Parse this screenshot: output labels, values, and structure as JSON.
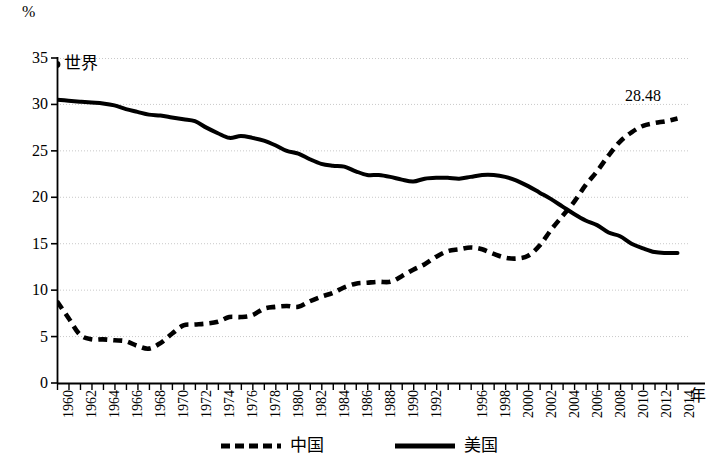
{
  "axes": {
    "y_unit": "%",
    "x_unit": "年",
    "y_ticks": [
      "0",
      "5",
      "10",
      "15",
      "20",
      "25",
      "30",
      "35"
    ],
    "x_ticks": [
      "1960",
      "1962",
      "1964",
      "1966",
      "1968",
      "1970",
      "1972",
      "1974",
      "1976",
      "1978",
      "1980",
      "1982",
      "1984",
      "1986",
      "1988",
      "1990",
      "1992",
      "1996",
      "1998",
      "2000",
      "2002",
      "2004",
      "2006",
      "2008",
      "2010",
      "2012",
      "2014"
    ]
  },
  "annotations": {
    "world_label": "世界",
    "china_end_value": "28.48"
  },
  "legend": {
    "items": [
      {
        "label": "中国",
        "style": "dashed",
        "color": "#000000"
      },
      {
        "label": "美国",
        "style": "solid",
        "color": "#000000"
      }
    ]
  },
  "chart_data": {
    "type": "line",
    "title": "",
    "subtitle": "",
    "xlabel": "年",
    "ylabel": "%",
    "xlim": [
      1960,
      2015
    ],
    "ylim": [
      0,
      35
    ],
    "yticks": [
      0,
      5,
      10,
      15,
      20,
      25,
      30,
      35
    ],
    "xticks": [
      1960,
      1962,
      1964,
      1966,
      1968,
      1970,
      1972,
      1974,
      1976,
      1978,
      1980,
      1982,
      1984,
      1986,
      1988,
      1990,
      1992,
      1996,
      1998,
      2000,
      2002,
      2004,
      2006,
      2008,
      2010,
      2012,
      2014
    ],
    "grid": true,
    "grid_axis": "y",
    "legend_position": "bottom",
    "annotations": [
      {
        "text": "世界",
        "x": 1960,
        "y": 34.3,
        "marker": true
      },
      {
        "text": "28.48",
        "x": 2013,
        "y": 30.0,
        "marker": false
      }
    ],
    "x": [
      1960,
      1961,
      1962,
      1963,
      1964,
      1965,
      1966,
      1967,
      1968,
      1969,
      1970,
      1971,
      1972,
      1973,
      1974,
      1975,
      1976,
      1977,
      1978,
      1979,
      1980,
      1981,
      1982,
      1983,
      1984,
      1985,
      1986,
      1987,
      1988,
      1989,
      1990,
      1991,
      1992,
      1993,
      1994,
      1995,
      1996,
      1997,
      1998,
      1999,
      2000,
      2001,
      2002,
      2003,
      2004,
      2005,
      2006,
      2007,
      2008,
      2009,
      2010,
      2011,
      2012,
      2013,
      2014
    ],
    "series": [
      {
        "name": "中国",
        "style": "dashed",
        "color": "#000000",
        "values": [
          8.8,
          7.0,
          5.2,
          4.7,
          4.7,
          4.6,
          4.5,
          4.0,
          3.7,
          4.3,
          5.3,
          6.2,
          6.3,
          6.4,
          6.6,
          7.1,
          7.1,
          7.3,
          8.0,
          8.2,
          8.3,
          8.2,
          8.8,
          9.3,
          9.7,
          10.3,
          10.7,
          10.8,
          10.9,
          10.9,
          11.5,
          12.2,
          12.8,
          13.6,
          14.2,
          14.4,
          14.6,
          14.4,
          13.9,
          13.5,
          13.4,
          13.7,
          14.8,
          16.5,
          18.0,
          19.5,
          21.3,
          22.8,
          24.5,
          26.0,
          27.0,
          27.7,
          28.0,
          28.2,
          28.48
        ]
      },
      {
        "name": "美国",
        "style": "solid",
        "color": "#000000",
        "values": [
          30.5,
          30.4,
          30.3,
          30.2,
          30.1,
          29.9,
          29.5,
          29.2,
          28.9,
          28.8,
          28.6,
          28.4,
          28.2,
          27.5,
          26.9,
          26.4,
          26.6,
          26.4,
          26.1,
          25.6,
          25.0,
          24.7,
          24.1,
          23.6,
          23.4,
          23.3,
          22.8,
          22.4,
          22.4,
          22.2,
          21.9,
          21.7,
          22.0,
          22.1,
          22.1,
          22.0,
          22.2,
          22.4,
          22.4,
          22.2,
          21.8,
          21.2,
          20.5,
          19.8,
          19.0,
          18.2,
          17.5,
          17.0,
          16.2,
          15.8,
          15.0,
          14.5,
          14.1,
          14.0,
          14.0
        ]
      }
    ]
  }
}
